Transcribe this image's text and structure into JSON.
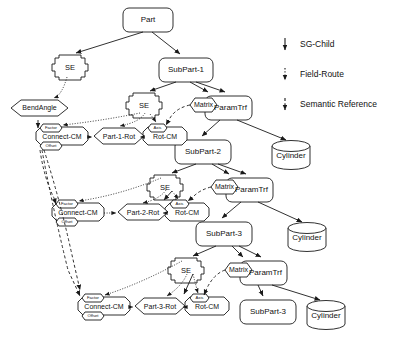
{
  "diagram": {
    "stroke_color": "#1a1a1a",
    "fill_color": "#ffffff",
    "nodes": {
      "part": "Part",
      "subpart1": "SubPart-1",
      "subpart2": "SubPart-2",
      "subpart3_a": "SubPart-3",
      "subpart3_b": "SubPart-3",
      "se1": "SE",
      "se2": "SE",
      "se3": "SE",
      "se4": "SE",
      "bendangle": "BendAngle",
      "paramtrf1": "ParamTrf",
      "paramtrf2": "ParamTrf",
      "paramtrf3": "ParamTrf",
      "matrix1": "Matrix",
      "matrix2": "Matrix",
      "matrix3": "Matrix",
      "cylinder1": "Cylinder",
      "cylinder2": "Cylinder",
      "cylinder3": "Cylinder",
      "connect_cm1": "Connect-CM",
      "connect_cm2": "Connect-CM",
      "connect_cm3": "Connect-CM",
      "rot_cm1": "Rot-CM",
      "rot_cm2": "Rot-CM",
      "rot_cm3": "Rot-CM",
      "part1rot": "Part-1-Rot",
      "part2rot": "Part-2-Rot",
      "part3rot": "Part-3-Rot",
      "factor1": "Factor",
      "factor2": "Factor",
      "factor3": "Factor",
      "offset1": "Offset",
      "offset2": "Offset",
      "offset3": "Offset",
      "axis1": "Axis",
      "axis2": "Axis",
      "axis3": "Axis"
    }
  },
  "legend": {
    "items": [
      {
        "label": "SG-Child",
        "style": "solid"
      },
      {
        "label": "Field-Route",
        "style": "dotted"
      },
      {
        "label": "Semantic Reference",
        "style": "dashed"
      }
    ]
  }
}
